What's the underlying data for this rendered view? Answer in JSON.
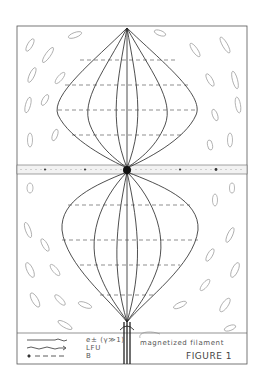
{
  "figure": {
    "title": "FIGURE 1",
    "annotation": "magnetized filament",
    "legend": [
      {
        "symbol": "solid-wavy-line",
        "label_main": "e±",
        "label_sub": "(γ≫1)"
      },
      {
        "symbol": "wavy-arrow",
        "label_main": "LFU",
        "label_sub": ""
      },
      {
        "symbol": "dot-dashed-line",
        "label_main": "B",
        "label_sub": ""
      }
    ],
    "colors": {
      "ink": "#222222",
      "faint": "#888888",
      "paper": "#ffffff"
    }
  }
}
